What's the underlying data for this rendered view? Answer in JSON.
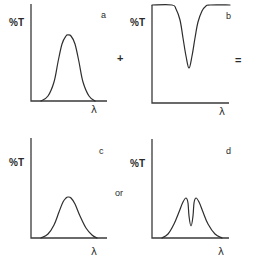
{
  "figure": {
    "ink_color": "#2e2e2e",
    "background_color": "#ffffff"
  },
  "panels": [
    {
      "id": "a",
      "letter": "a",
      "ylabel": "%T",
      "xlabel": "λ",
      "shape": "single broad transmission peak",
      "axes": {
        "origin": [
          31,
          101
        ],
        "y_top": 4,
        "x_end": 107
      },
      "curve_points": [
        [
          41,
          101
        ],
        [
          48,
          96
        ],
        [
          54,
          82
        ],
        [
          58,
          62
        ],
        [
          62,
          44
        ],
        [
          66,
          36
        ],
        [
          68,
          35
        ],
        [
          71,
          36
        ],
        [
          75,
          44
        ],
        [
          79,
          62
        ],
        [
          83,
          82
        ],
        [
          89,
          96
        ],
        [
          95,
          101
        ]
      ],
      "labels": {
        "ylabel_pos": [
          9,
          26
        ],
        "letter_pos": [
          101,
          18
        ],
        "xlabel_pos": [
          91,
          113
        ]
      }
    },
    {
      "id": "b",
      "letter": "b",
      "ylabel": "%T",
      "xlabel": "λ",
      "shape": "flat 100% baseline with narrow absorption dip",
      "axes": {
        "origin": [
          152,
          103
        ],
        "y_top": 5,
        "x_end": 229
      },
      "curve_points": [
        [
          152,
          5
        ],
        [
          172,
          5
        ],
        [
          176,
          9
        ],
        [
          180,
          20
        ],
        [
          183,
          38
        ],
        [
          186,
          56
        ],
        [
          189,
          68
        ],
        [
          192,
          56
        ],
        [
          195,
          38
        ],
        [
          198,
          22
        ],
        [
          202,
          11
        ],
        [
          206,
          6
        ],
        [
          210,
          5
        ],
        [
          230,
          5
        ]
      ],
      "labels": {
        "ylabel_pos": [
          130,
          26
        ],
        "letter_pos": [
          226,
          19
        ],
        "xlabel_pos": [
          219,
          115
        ]
      }
    },
    {
      "id": "c",
      "letter": "c",
      "ylabel": "%T",
      "xlabel": "λ",
      "shape": "single reduced transmission peak",
      "axes": {
        "origin": [
          31,
          238
        ],
        "y_top": 138,
        "x_end": 107
      },
      "curve_points": [
        [
          41,
          238
        ],
        [
          48,
          234
        ],
        [
          54,
          225
        ],
        [
          59,
          212
        ],
        [
          63,
          202
        ],
        [
          66,
          198
        ],
        [
          68,
          197
        ],
        [
          71,
          198
        ],
        [
          75,
          204
        ],
        [
          80,
          216
        ],
        [
          86,
          228
        ],
        [
          92,
          235
        ],
        [
          97,
          238
        ]
      ],
      "labels": {
        "ylabel_pos": [
          9,
          166
        ],
        "letter_pos": [
          99,
          154
        ],
        "xlabel_pos": [
          91,
          255
        ]
      }
    },
    {
      "id": "d",
      "letter": "d",
      "ylabel": "%T",
      "xlabel": "λ",
      "shape": "peak split by central narrow absorption dip",
      "axes": {
        "origin": [
          152,
          238
        ],
        "y_top": 139,
        "x_end": 229
      },
      "curve_points": [
        [
          162,
          238
        ],
        [
          168,
          234
        ],
        [
          174,
          224
        ],
        [
          179,
          212
        ],
        [
          183,
          202
        ],
        [
          186,
          198
        ],
        [
          188,
          203
        ],
        [
          189,
          216
        ],
        [
          191,
          226
        ],
        [
          193,
          216
        ],
        [
          194,
          203
        ],
        [
          196,
          198
        ],
        [
          199,
          202
        ],
        [
          203,
          212
        ],
        [
          208,
          224
        ],
        [
          215,
          234
        ],
        [
          222,
          238
        ]
      ],
      "labels": {
        "ylabel_pos": [
          130,
          167
        ],
        "letter_pos": [
          226,
          154
        ],
        "xlabel_pos": [
          218,
          255
        ]
      }
    }
  ],
  "operators": {
    "plus": {
      "symbol": "+",
      "pos": [
        117,
        62
      ]
    },
    "equals": {
      "symbol": "=",
      "pos": [
        235,
        64
      ]
    },
    "or": {
      "symbol": "or",
      "pos": [
        115,
        196
      ]
    }
  }
}
